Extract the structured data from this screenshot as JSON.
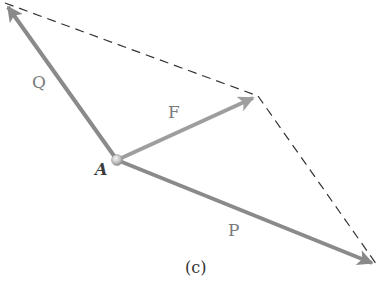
{
  "figure": {
    "caption": "(c)",
    "colors": {
      "vector": "#8a8a8a",
      "resultant": "#9e9e9e",
      "dashed": "#333333",
      "point": "#c9c9c9",
      "label": "#7a7a7a",
      "point_label": "#3a3a3a"
    },
    "point": {
      "label": "A",
      "x": 117,
      "y": 160
    },
    "vectors": [
      {
        "id": "Q",
        "label": "Q",
        "from": [
          117,
          160
        ],
        "to": [
          5,
          3
        ]
      },
      {
        "id": "F",
        "label": "F",
        "from": [
          117,
          160
        ],
        "to": [
          258,
          96
        ]
      },
      {
        "id": "P",
        "label": "P",
        "from": [
          117,
          160
        ],
        "to": [
          377,
          265
        ]
      }
    ],
    "dashed_lines": [
      {
        "from": [
          5,
          3
        ],
        "to": [
          258,
          96
        ]
      },
      {
        "from": [
          258,
          96
        ],
        "to": [
          377,
          265
        ]
      }
    ],
    "labels": {
      "Q": {
        "text": "Q",
        "x": 32,
        "y": 74
      },
      "F": {
        "text": "F",
        "x": 168,
        "y": 104
      },
      "P": {
        "text": "P",
        "x": 228,
        "y": 222
      },
      "A": {
        "text": "A",
        "x": 95,
        "y": 162
      },
      "caption": {
        "text": "(c)",
        "x": 185,
        "y": 260
      }
    }
  }
}
